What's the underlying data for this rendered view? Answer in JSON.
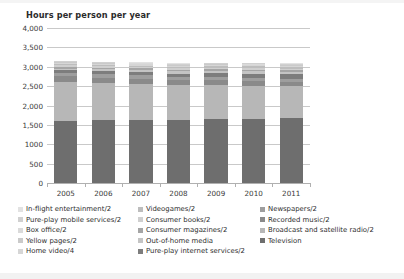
{
  "chart_data": {
    "type": "bar",
    "subtype": "stacked-bar",
    "title": "Hours per person per year",
    "xlabel": "",
    "ylabel": "",
    "ylim": [
      0,
      4000
    ],
    "yticks": [
      "0",
      "500",
      "1000",
      "1,500",
      "2,000",
      "2,500",
      "3,000",
      "3,500",
      "4,000"
    ],
    "ytick_values": [
      0,
      500,
      1000,
      1500,
      2000,
      2500,
      3000,
      3500,
      4000
    ],
    "grid": true,
    "legend_position": "below",
    "categories": [
      "2005",
      "2006",
      "2007",
      "2008",
      "2009",
      "2010",
      "2011"
    ],
    "series": [
      {
        "name": "Television",
        "color": "#6e6e6e",
        "values": [
          1600,
          1620,
          1630,
          1620,
          1650,
          1660,
          1665
        ]
      },
      {
        "name": "Broadcast and satellite radio/2",
        "color": "#b7b7b7",
        "values": [
          1000,
          960,
          930,
          900,
          880,
          855,
          830
        ]
      },
      {
        "name": "Recorded music/2",
        "color": "#8a8a8a",
        "values": [
          150,
          140,
          135,
          130,
          125,
          120,
          115
        ]
      },
      {
        "name": "Newspapers/2",
        "color": "#9e9e9e",
        "values": [
          95,
          90,
          86,
          82,
          78,
          74,
          70
        ]
      },
      {
        "name": "Pure-play internet services/2",
        "color": "#7d7d7d",
        "values": [
          60,
          70,
          80,
          92,
          105,
          118,
          130
        ]
      },
      {
        "name": "Out-of-home media",
        "color": "#c4c4c4",
        "values": [
          50,
          52,
          54,
          56,
          58,
          60,
          62
        ]
      },
      {
        "name": "Consumer magazines/2",
        "color": "#a5a5a5",
        "values": [
          45,
          44,
          43,
          42,
          41,
          40,
          39
        ]
      },
      {
        "name": "Consumer books/2",
        "color": "#cfcfcf",
        "values": [
          40,
          40,
          39,
          39,
          38,
          38,
          37
        ]
      },
      {
        "name": "Videogames/2",
        "color": "#bdbdbd",
        "values": [
          30,
          33,
          36,
          38,
          41,
          44,
          47
        ]
      },
      {
        "name": "Home video/4",
        "color": "#d6d6d6",
        "values": [
          28,
          29,
          30,
          31,
          31,
          32,
          32
        ]
      },
      {
        "name": "Yellow pages/2",
        "color": "#cacaca",
        "values": [
          20,
          19,
          18,
          17,
          16,
          15,
          14
        ]
      },
      {
        "name": "Box office/2",
        "color": "#dadada",
        "values": [
          14,
          14,
          14,
          13,
          13,
          13,
          13
        ]
      },
      {
        "name": "Pure-play mobile services/2",
        "color": "#d0d0d0",
        "values": [
          10,
          13,
          16,
          19,
          23,
          27,
          31
        ]
      },
      {
        "name": "In-flight entertainment/2",
        "color": "#e2e2e2",
        "values": [
          8,
          8,
          8,
          8,
          8,
          8,
          8
        ]
      }
    ],
    "totals": [
      3150,
      3132,
      3119,
      3097,
      3107,
      3104,
      3093
    ]
  },
  "legend": {
    "columns": [
      {
        "items": [
          {
            "label": "In-flight entertainment/2",
            "color": "#e2e2e2"
          },
          {
            "label": "Pure-play mobile services/2",
            "color": "#d0d0d0"
          },
          {
            "label": "Box office/2",
            "color": "#dadada"
          },
          {
            "label": "Yellow pages/2",
            "color": "#cacaca"
          },
          {
            "label": "Home video/4",
            "color": "#d6d6d6"
          }
        ]
      },
      {
        "items": [
          {
            "label": "Videogames/2",
            "color": "#bdbdbd"
          },
          {
            "label": "Consumer books/2",
            "color": "#cfcfcf"
          },
          {
            "label": "Consumer magazines/2",
            "color": "#a5a5a5"
          },
          {
            "label": "Out-of-home media",
            "color": "#c4c4c4"
          },
          {
            "label": "Pure-play internet services/2",
            "color": "#7d7d7d"
          }
        ]
      },
      {
        "items": [
          {
            "label": "Newspapers/2",
            "color": "#9e9e9e"
          },
          {
            "label": "Recorded music/2",
            "color": "#8a8a8a"
          },
          {
            "label": "Broadcast and satellite radio/2",
            "color": "#b7b7b7"
          },
          {
            "label": "Television",
            "color": "#6e6e6e"
          }
        ]
      }
    ]
  },
  "style": {
    "gridline_color": "#c9c9c9",
    "axis_color": "#b0b0b0",
    "text_color": "#2e2e2e",
    "background": "#ffffff"
  }
}
